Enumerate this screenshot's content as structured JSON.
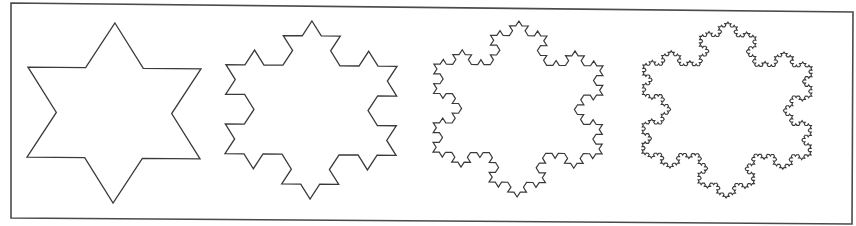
{
  "figure": {
    "background": "#ffffff",
    "stroke_color": "#3a3a3a",
    "frame": {
      "points": [
        [
          11,
          3
        ],
        [
          853,
          12
        ],
        [
          852,
          224
        ],
        [
          11,
          218
        ]
      ],
      "stroke_color": "#4a4a4a",
      "stroke_width": 1.6
    },
    "snowflakes": [
      {
        "name": "koch-iteration-1",
        "iterations": 1,
        "cx": 114,
        "cy": 113,
        "radius": 90,
        "scale_x": 1.11,
        "rotation_deg": 0.6,
        "stroke_width": 1.3
      },
      {
        "name": "koch-iteration-2",
        "iterations": 2,
        "cx": 311,
        "cy": 110,
        "radius": 89,
        "scale_x": 1.11,
        "rotation_deg": 0.6,
        "stroke_width": 1.3
      },
      {
        "name": "koch-iteration-3",
        "iterations": 3,
        "cx": 518,
        "cy": 109,
        "radius": 88,
        "scale_x": 1.11,
        "rotation_deg": 0.6,
        "stroke_width": 1.2
      },
      {
        "name": "koch-iteration-4",
        "iterations": 4,
        "cx": 727,
        "cy": 110,
        "radius": 88,
        "scale_x": 1.11,
        "rotation_deg": 0.6,
        "stroke_width": 1.1
      }
    ]
  }
}
